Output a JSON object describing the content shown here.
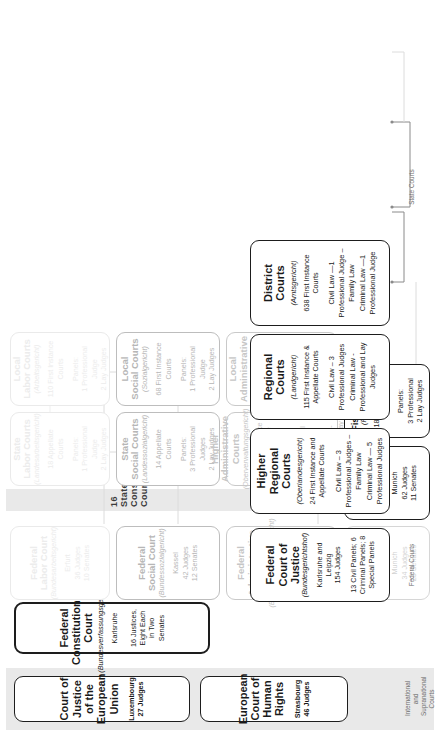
{
  "diagram": {
    "rails": [
      {
        "id": "international",
        "label": "International and\nSupranational Courts"
      },
      {
        "id": "federal",
        "label": "Federal Courts"
      },
      {
        "id": "state",
        "label": "State Courts"
      }
    ],
    "state_constitutional_label": "16   State Constitutional   Courts",
    "headers": [
      {
        "id": "cjeu",
        "title": "Court of Justice of the European Union",
        "german": "",
        "meta": "Luxembourg\n27 Judges"
      },
      {
        "id": "echr",
        "title": "European Court of Human Rights",
        "german": "",
        "meta": "Strasbourg\n46 Judges"
      },
      {
        "id": "bverfg",
        "title": "Federal Constitutional Court",
        "german": "(Bundesverfassungsgericht)",
        "meta": "Karlsruhe\n\n16 Justices, Eight Each in Two Senates"
      }
    ],
    "columns": [
      {
        "id": "ordinary",
        "boxes": [
          {
            "id": "bgh",
            "title": "Federal Court of Justice",
            "german": "(Bundesgerichtshof)",
            "meta": "Karlsruhe and Leipzig\n154 Judges",
            "detail": "13 Civil Panels; 6 Criminal Panels; 8 Special Panels"
          },
          {
            "id": "olg",
            "title": "Higher Regional Courts",
            "german": "(Oberlandesgericht)",
            "meta": "24 First Instance and Appellate Courts",
            "civil": "Civil Law – 3 Professional Judges – Family Law",
            "criminal": "Criminal Law — 5 Professional Judges"
          },
          {
            "id": "lg",
            "title": "Regional Courts",
            "german": "(Landgericht)",
            "meta": "115 First Instance & Appellate Courts",
            "civil": "Civil Law – 3 Professional Judges",
            "criminal": "Criminal Law - Professional and Lay Judges"
          },
          {
            "id": "ag",
            "title": "District Courts",
            "german": "(Amtsgericht)",
            "meta": "638 First Instance Courts",
            "civil": "Civil Law —1 Professional Judge – Family Law",
            "criminal": "Criminal Law —1 Professional Judge"
          }
        ]
      },
      {
        "id": "administrative",
        "boxes": [
          {
            "id": "bverwg",
            "title": "Federal\nAdministrative Court",
            "german": "(Bundesverwaltungsgericht)",
            "meta": "Leipzig\n55 Judges\n10 General Senates\n3 Special Senates"
          },
          {
            "id": "ovg",
            "title": "Higher\nAdministrative Courts",
            "german": "(Oberverwaltungsgericht)",
            "meta": "15 First Instance\nand Appellate Courts",
            "panel": "Panels:\n3 Professional Judges\nSometimes 5 Judges (3 Pro-\nfessional and Lay Judges)"
          },
          {
            "id": "vg",
            "title": "Local\nAdministrative Courts",
            "german": "(Verwaltungsgericht)",
            "meta": "51 First Instance Courts",
            "panel": "Panels:\n3 Professional Judges\n2 Lay Judges"
          }
        ]
      },
      {
        "id": "social",
        "boxes": [
          {
            "id": "bsg",
            "title": "Federal\nSocial Court",
            "german": "(Bundessozialgericht)",
            "meta": "Kassel\n42 Judges\n12 Senates"
          },
          {
            "id": "lsg",
            "title": "State\nSocial Courts",
            "german": "(Landessozialgericht)",
            "meta": "14 Appellate Courts",
            "panel": "Panels:\n3 Professional Judges\n2 Lay Judges"
          },
          {
            "id": "sg",
            "title": "Local\nSocial Courts",
            "german": "(Sozialgericht)",
            "meta": "68 First Instance Courts",
            "panel": "Panels:\n1 Professional Judge\n2 Lay Judges"
          }
        ]
      },
      {
        "id": "labor",
        "boxes": [
          {
            "id": "bag",
            "title": "Federal\nLabor Court",
            "german": "(Bundesarbeitsgericht)",
            "meta": "Erfurt\n36 Judges\n10 Senates"
          },
          {
            "id": "lag",
            "title": "State\nLabor Courts",
            "german": "(Landesarbeitsgericht)",
            "meta": "18 Appellate Courts",
            "panel": "Panels:\n1 Professional Judge\n2 Lay Judges"
          },
          {
            "id": "arbg",
            "title": "Local\nLabor Courts",
            "german": "(Arbeitsgericht)",
            "meta": "110 First Instance Courts",
            "panel": "Panels:\n1 Professional Judge\n2 Lay Judges"
          }
        ]
      },
      {
        "id": "fiscal",
        "boxes": [
          {
            "id": "bpatg",
            "title": "Federal Patent Court",
            "german": "(Bundespatentgericht)",
            "meta": "Munich\n34 Judges\n23 Senates"
          },
          {
            "id": "bfh",
            "title": "Federal Fiscal Court",
            "german": "(Bundesfinanzhof)",
            "meta": "Munich\n62 Judges\n11 Senates"
          },
          {
            "id": "fg",
            "title": "Fiscal Courts",
            "german": "(Finanzgericht)",
            "meta": "18 First Instance Courts",
            "panel": "Panels:\n3 Professional\n2 Lay Judges"
          }
        ]
      }
    ]
  }
}
